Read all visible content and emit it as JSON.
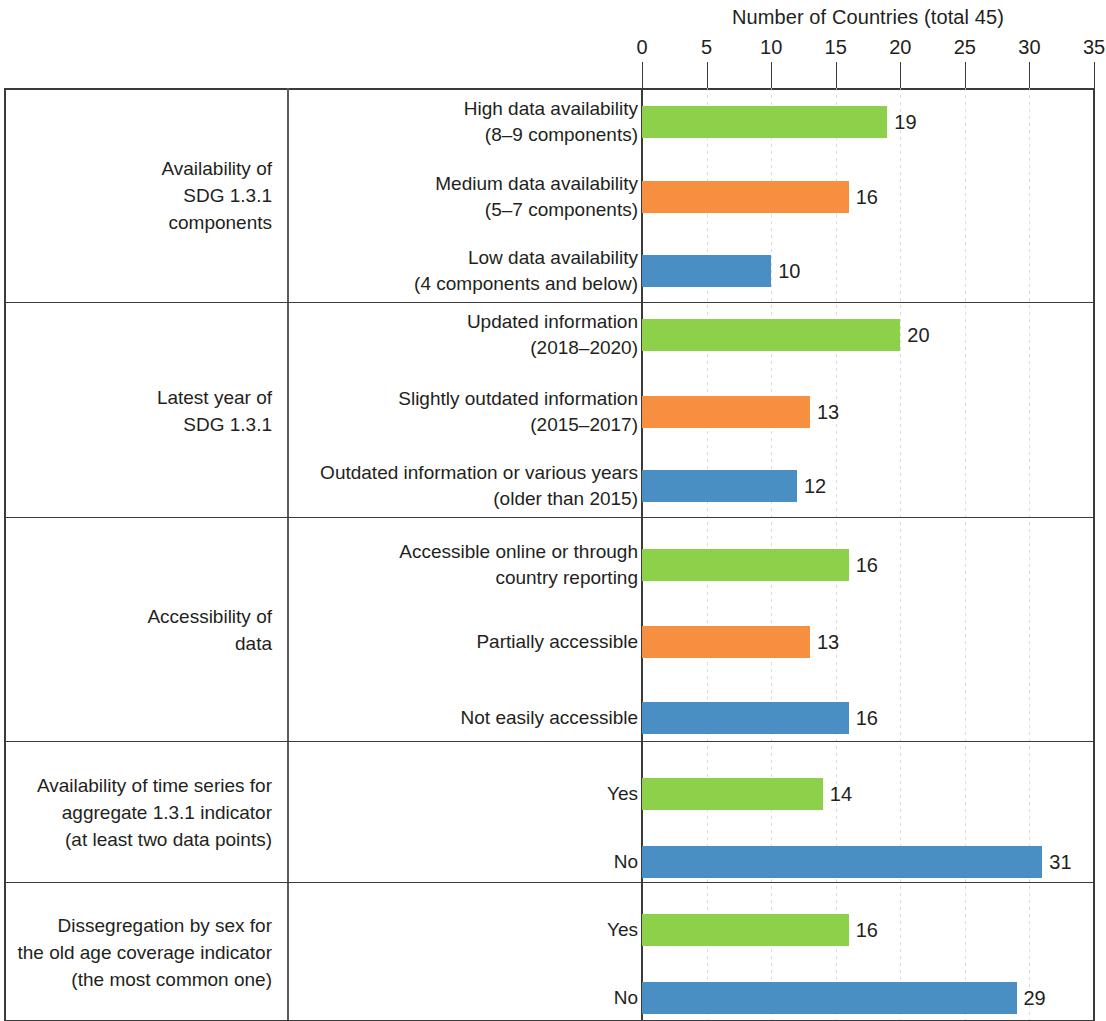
{
  "chart_data": {
    "type": "bar",
    "orientation": "horizontal",
    "title": "Number of Countries (total 45)",
    "xlabel": "Number of Countries (total 45)",
    "ylabel": "",
    "xlim": [
      0,
      35
    ],
    "xticks": [
      0,
      5,
      10,
      15,
      20,
      25,
      30,
      35
    ],
    "xtick_labels": [
      "0",
      "5",
      "10",
      "15",
      "20",
      "25",
      "30",
      "35"
    ],
    "grid": true,
    "legend": "none",
    "total_countries": 45,
    "colors": {
      "green": "#8DD14B",
      "orange": "#F69040",
      "blue": "#4A8FC4"
    },
    "groups": [
      {
        "name": "Availability of\nSDG 1.3.1\ncomponents",
        "bars": [
          {
            "label": "High data availability\n(8–9 components)",
            "value": 19,
            "color": "green"
          },
          {
            "label": "Medium data availability\n(5–7 components)",
            "value": 16,
            "color": "orange"
          },
          {
            "label": "Low data availability\n(4 components and below)",
            "value": 10,
            "color": "blue"
          }
        ]
      },
      {
        "name": "Latest year of\nSDG 1.3.1",
        "bars": [
          {
            "label": "Updated information\n(2018–2020)",
            "value": 20,
            "color": "green"
          },
          {
            "label": "Slightly outdated information\n(2015–2017)",
            "value": 13,
            "color": "orange"
          },
          {
            "label": "Outdated information or various years\n(older than 2015)",
            "value": 12,
            "color": "blue"
          }
        ]
      },
      {
        "name": "Accessibility of\ndata",
        "bars": [
          {
            "label": "Accessible online or through\ncountry reporting",
            "value": 16,
            "color": "green"
          },
          {
            "label": "Partially accessible",
            "value": 13,
            "color": "orange"
          },
          {
            "label": "Not easily accessible",
            "value": 16,
            "color": "blue"
          }
        ]
      },
      {
        "name": "Availability of time series for\naggregate 1.3.1 indicator\n(at least two data points)",
        "bars": [
          {
            "label": "Yes",
            "value": 14,
            "color": "green"
          },
          {
            "label": "No",
            "value": 31,
            "color": "blue"
          }
        ]
      },
      {
        "name": "Dissegregation by sex for\nthe old age coverage indicator\n(the most common one)",
        "bars": [
          {
            "label": "Yes",
            "value": 16,
            "color": "green"
          },
          {
            "label": "No",
            "value": 29,
            "color": "blue"
          }
        ]
      }
    ]
  }
}
